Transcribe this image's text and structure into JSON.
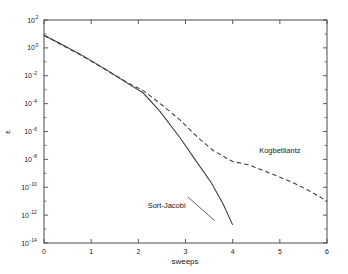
{
  "chart_data": {
    "type": "line",
    "title": "",
    "xlabel": "sweeps",
    "ylabel": "ε",
    "xlim": [
      0,
      6
    ],
    "ylim": [
      1e-14,
      100
    ],
    "yscale": "log",
    "grid": false,
    "legend_position": "inline-annotations",
    "xticks": [
      "0",
      "1",
      "2",
      "3",
      "4",
      "5",
      "6"
    ],
    "xtick_values": [
      0,
      1,
      2,
      3,
      4,
      5,
      6
    ],
    "yticks": [
      "10^2",
      "10^0",
      "10^-2",
      "10^-4",
      "10^-6",
      "10^-8",
      "10^-10",
      "10^-12",
      "10^-14"
    ],
    "ytick_mantissa": [
      "10",
      "10",
      "10",
      "10",
      "10",
      "10",
      "10",
      "10",
      "10"
    ],
    "ytick_exponents": [
      "2",
      "0",
      "-2",
      "-4",
      "-6",
      "-8",
      "-10",
      "-12",
      "-14"
    ],
    "ytick_values": [
      100,
      1,
      0.01,
      0.0001,
      1e-06,
      1e-08,
      1e-10,
      1e-12,
      1e-14
    ],
    "series": [
      {
        "name": "Sort-Jacobi",
        "style": "solid",
        "annotation": "Sort-Jacobi",
        "x": [
          0.0,
          0.35,
          0.8,
          1.3,
          1.8,
          2.1,
          2.45,
          2.9,
          3.2,
          3.55,
          3.8,
          4.0
        ],
        "y": [
          8.0,
          2.0,
          0.3,
          0.03,
          0.0025,
          0.0006,
          3e-05,
          3e-07,
          1e-08,
          2e-10,
          6e-12,
          2e-13
        ]
      },
      {
        "name": "Kogbetliantz",
        "style": "dashed",
        "annotation": "Kogbetliantz",
        "x": [
          0.0,
          0.35,
          0.8,
          1.3,
          1.8,
          2.1,
          2.5,
          2.9,
          3.25,
          3.6,
          4.0,
          4.35,
          4.8,
          5.3,
          5.7,
          6.0
        ],
        "y": [
          8.0,
          1.8,
          0.28,
          0.028,
          0.0028,
          0.0009,
          8e-05,
          6e-06,
          4e-07,
          4e-08,
          7e-09,
          4e-09,
          1e-09,
          2e-10,
          4e-11,
          1e-11
        ]
      }
    ],
    "annotations": [
      {
        "text": "Kogbetliantz",
        "x": 5.0,
        "y": 3e-08
      },
      {
        "text": "Sort-Jacobi",
        "x": 2.6,
        "y": 3e-12
      }
    ]
  },
  "colors": {
    "background": "#ffffff",
    "axis": "#4a4a4a",
    "curve": "#3a3a3a",
    "text": "#1a1a1a"
  }
}
